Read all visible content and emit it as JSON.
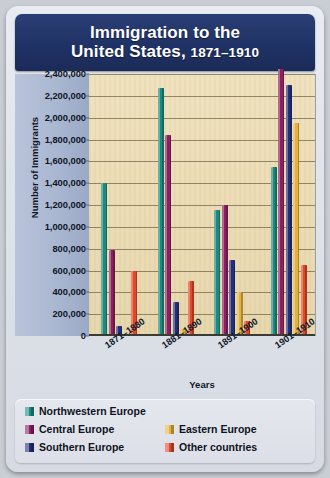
{
  "title": {
    "line1": "Immigration to the",
    "line2": "United States, ",
    "years": "1871–1910"
  },
  "chart_data": {
    "type": "bar",
    "title": "Immigration to the United States, 1871–1910",
    "xlabel": "Years",
    "ylabel": "Number of Immigrants",
    "ylim": [
      0,
      2400000
    ],
    "ytick_step": 200000,
    "grid": true,
    "legend_position": "bottom",
    "categories": [
      "1871–1880",
      "1881–1890",
      "1891–1900",
      "1901–1910"
    ],
    "ytick_labels": [
      "2,400,000",
      "2,200,000",
      "2,000,000",
      "1,800,000",
      "1,600,000",
      "1,400,000",
      "1,200,000",
      "1,000,000",
      "800,000",
      "600,000",
      "400,000",
      "200,000",
      "0"
    ],
    "series": [
      {
        "name": "Northwestern Europe",
        "color": "#1d8a80",
        "values": [
          1400000,
          2270000,
          1150000,
          1550000
        ]
      },
      {
        "name": "Central Europe",
        "color": "#8b2060",
        "values": [
          790000,
          1840000,
          1200000,
          2450000
        ]
      },
      {
        "name": "Southern Europe",
        "color": "#232f78",
        "values": [
          90000,
          310000,
          700000,
          2300000
        ]
      },
      {
        "name": "Eastern Europe",
        "color": "#e4b23c",
        "values": [
          0,
          60000,
          400000,
          1950000
        ]
      },
      {
        "name": "Other countries",
        "color": "#e0482a",
        "values": [
          600000,
          500000,
          140000,
          650000
        ]
      }
    ]
  },
  "legend": [
    {
      "label": "Northwestern Europe",
      "color": "#1d8a80"
    },
    {
      "label": "Central Europe",
      "color": "#8b2060"
    },
    {
      "label": "Southern Europe",
      "color": "#232f78"
    },
    {
      "label": "Eastern Europe",
      "color": "#e4b23c"
    },
    {
      "label": "Other countries",
      "color": "#e0482a"
    }
  ]
}
